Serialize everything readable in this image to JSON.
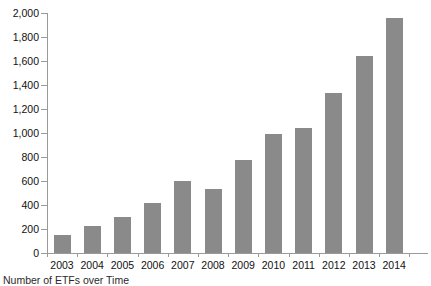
{
  "caption": "Number of ETFs over Time",
  "colors": {
    "bar": "#8a8a8a",
    "axis": "#9a9a9a",
    "text": "#111111",
    "background": "#ffffff"
  },
  "chart_data": {
    "type": "bar",
    "title": "",
    "xlabel": "",
    "ylabel": "",
    "categories": [
      "2003",
      "2004",
      "2005",
      "2006",
      "2007",
      "2008",
      "2009",
      "2010",
      "2011",
      "2012",
      "2013",
      "2014"
    ],
    "values": [
      150,
      225,
      300,
      415,
      600,
      530,
      775,
      990,
      1040,
      1330,
      1640,
      1960
    ],
    "ylim": [
      0,
      2000
    ],
    "yticks": [
      0,
      200,
      400,
      600,
      800,
      1000,
      1200,
      1400,
      1600,
      1800,
      2000
    ],
    "ytick_labels": [
      "0",
      "200",
      "400",
      "600",
      "800",
      "1,000",
      "1,200",
      "1,400",
      "1,600",
      "1,800",
      "2,000"
    ],
    "grid": false,
    "legend": null
  }
}
